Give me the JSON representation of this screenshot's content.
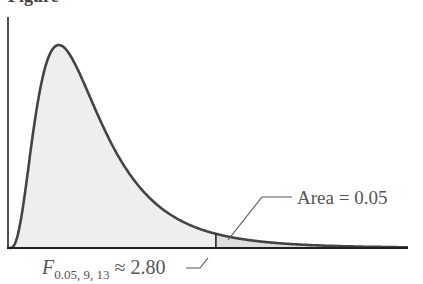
{
  "figure": {
    "caption_fragment": "Figure"
  },
  "chart_data": {
    "type": "area",
    "title": "",
    "distribution": "F",
    "df1": 9,
    "df2": 13,
    "xlim": [
      0,
      5.4
    ],
    "alpha": 0.05,
    "critical_value": 2.8,
    "annotations": {
      "area_label": "Area = 0.05",
      "critical_label_var": "F",
      "critical_label_sub": "0.05, 9, 13",
      "critical_label_rest": " ≈ 2.80"
    },
    "colors": {
      "curve": "#444444",
      "fill_body": "#eeeeee",
      "fill_tail": "#dedede",
      "axis": "#222222",
      "text": "#555555"
    }
  }
}
